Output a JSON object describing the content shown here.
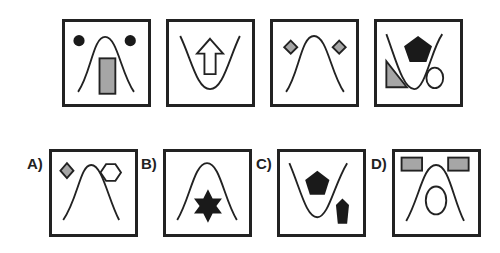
{
  "question_row": [
    {
      "id": "q1",
      "curve": "peak",
      "shapes": [
        "black circle (left)",
        "black circle (right)",
        "gray tall rectangle (center)"
      ]
    },
    {
      "id": "q2",
      "curve": "valley",
      "shapes": [
        "white up arrow (center)"
      ]
    },
    {
      "id": "q3",
      "curve": "peak",
      "shapes": [
        "gray diamond (left)",
        "gray diamond (right)"
      ]
    },
    {
      "id": "q4",
      "curve": "valley",
      "shapes": [
        "black pentagon (center)",
        "gray right triangle (bottom-left)",
        "white ellipse (bottom-right)"
      ]
    }
  ],
  "answers": [
    {
      "label": "A)",
      "curve": "peak",
      "shapes": [
        "gray diamond",
        "white hexagon"
      ]
    },
    {
      "label": "B)",
      "curve": "peak",
      "shapes": [
        "black six-pointed star"
      ]
    },
    {
      "label": "C)",
      "curve": "valley",
      "shapes": [
        "black pentagon",
        "small black pentagon"
      ]
    },
    {
      "label": "D)",
      "curve": "peak",
      "shapes": [
        "gray rectangle (left)",
        "gray rectangle (right)",
        "white ellipse"
      ]
    }
  ],
  "colors": {
    "stroke": "#222222",
    "gray_fill": "#a6a6a6",
    "black_fill": "#1a1a1a"
  }
}
